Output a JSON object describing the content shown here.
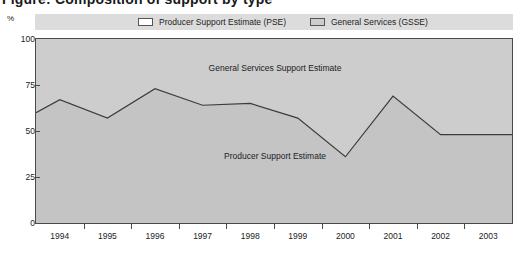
{
  "title": "Figure: Composition of support by type",
  "legend": {
    "items": [
      {
        "label": "Producer Support Estimate (PSE)",
        "icon": "legend-swatch-open",
        "color": "#ffffff"
      },
      {
        "label": "General Services (GSSE)",
        "icon": "legend-swatch-filled",
        "color": "#cdcdcd"
      }
    ]
  },
  "annotations": {
    "upper": "General Services Support Estimate",
    "lower": "Producer Support Estimate"
  },
  "axes": {
    "y_unit": "%",
    "y_ticks": [
      "0",
      "25",
      "50",
      "75",
      "100"
    ],
    "x_ticks": [
      "1994",
      "1995",
      "1996",
      "1997",
      "1998",
      "1999",
      "2000",
      "2001",
      "2002",
      "2003"
    ]
  },
  "colors": {
    "plot_background": "#cdcdcd",
    "legend_background": "#dcdcdc",
    "area_fill": "#c4c4c4",
    "line": "#3c3c3c",
    "frame": "#4a4a4a",
    "text": "#1c1c1c"
  },
  "chart_data": {
    "type": "area",
    "title": "Composition of support by type",
    "xlabel": "",
    "ylabel": "%",
    "ylim": [
      0,
      100
    ],
    "xlim": [
      1993.5,
      2003.5
    ],
    "grid": false,
    "legend_position": "top",
    "categories": [
      "1994",
      "1995",
      "1996",
      "1997",
      "1998",
      "1999",
      "2000",
      "2001",
      "2002",
      "2003"
    ],
    "series": [
      {
        "name": "Producer Support Estimate",
        "values": [
          67,
          57,
          73,
          64,
          65,
          57,
          36,
          69,
          48,
          48
        ]
      }
    ],
    "boundary_points": [
      {
        "x": 1993.5,
        "y": 60
      },
      {
        "x": 1994,
        "y": 67
      },
      {
        "x": 1995,
        "y": 57
      },
      {
        "x": 1996,
        "y": 73
      },
      {
        "x": 1997,
        "y": 64
      },
      {
        "x": 1998,
        "y": 65
      },
      {
        "x": 1999,
        "y": 57
      },
      {
        "x": 2000,
        "y": 36
      },
      {
        "x": 2001,
        "y": 69
      },
      {
        "x": 2002,
        "y": 48
      },
      {
        "x": 2003.5,
        "y": 48
      }
    ],
    "regions": [
      {
        "name": "General Services Support Estimate",
        "position": "above-line"
      },
      {
        "name": "Producer Support Estimate",
        "position": "below-line"
      }
    ]
  }
}
